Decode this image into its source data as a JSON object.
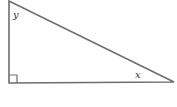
{
  "diagram": {
    "type": "right-triangle",
    "angles": {
      "top": "y",
      "right": "x"
    },
    "right_angle_marker": "bottom-left",
    "stroke_color": "#6e6e6e"
  }
}
